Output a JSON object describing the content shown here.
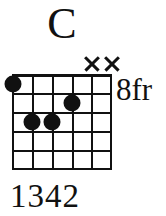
{
  "chord": {
    "name": "C",
    "position_label": "8fr",
    "fingering": "1342",
    "instrument": "guitar",
    "string_count": 6,
    "fret_count": 5,
    "base_fret": 8,
    "ink_color": "#111111",
    "background_color": "#ffffff",
    "strings": [
      {
        "index": 1,
        "x": 0,
        "fret": 1,
        "finger": "1",
        "state": "fretted"
      },
      {
        "index": 2,
        "x": 20,
        "fret": 3,
        "finger": "3",
        "state": "fretted"
      },
      {
        "index": 3,
        "x": 40,
        "fret": 3,
        "finger": "4",
        "state": "fretted"
      },
      {
        "index": 4,
        "x": 60,
        "fret": 2,
        "finger": "2",
        "state": "fretted"
      },
      {
        "index": 5,
        "x": 80,
        "fret": 0,
        "finger": "",
        "state": "muted"
      },
      {
        "index": 6,
        "x": 100,
        "fret": 0,
        "finger": "",
        "state": "muted"
      }
    ],
    "dots": [
      {
        "label": "dot-string-1-fret-1",
        "left": 1,
        "top": 10
      },
      {
        "label": "dot-string-4-fret-2",
        "left": 60,
        "top": 29
      },
      {
        "label": "dot-string-2-fret-3",
        "left": 20,
        "top": 48
      },
      {
        "label": "dot-string-3-fret-3",
        "left": 40,
        "top": 48
      }
    ],
    "mutes": [
      {
        "label": "mute-string-5",
        "left": 80
      },
      {
        "label": "mute-string-6",
        "left": 100
      }
    ],
    "fret_rows": [
      0,
      19,
      38,
      57,
      76,
      94
    ],
    "string_cols": [
      0,
      20,
      40,
      60,
      80,
      98
    ]
  }
}
